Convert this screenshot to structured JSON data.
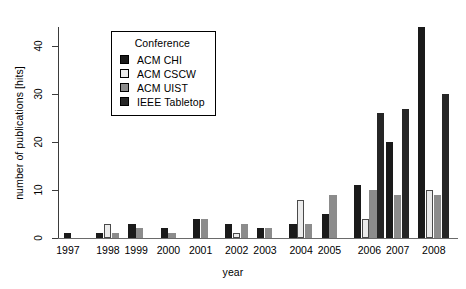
{
  "chart_data": {
    "type": "bar",
    "title": "",
    "subtitle": "",
    "xlabel": "year",
    "ylabel": "number of publications [hits]",
    "categories": [
      "1997",
      "1998",
      "1999",
      "2000",
      "2001",
      "2002",
      "2003",
      "2004",
      "2005",
      "2006",
      "2007",
      "2008"
    ],
    "ylim": [
      0,
      44
    ],
    "yticks": [
      0,
      10,
      20,
      30,
      40
    ],
    "ytick_labels": [
      "0",
      "10",
      "20",
      "30",
      "40"
    ],
    "grid": false,
    "legend_position": "top-left-inside",
    "legend_title": "Conference",
    "series": [
      {
        "name": "ACM CHI",
        "color": "#1a1a1a",
        "values": [
          1,
          1,
          3,
          2,
          4,
          3,
          2,
          3,
          5,
          11,
          20,
          44
        ]
      },
      {
        "name": "ACM CSCW",
        "color": "#ececec",
        "values": [
          0,
          3,
          0,
          0,
          0,
          1,
          0,
          8,
          0,
          4,
          0,
          10
        ]
      },
      {
        "name": "ACM UIST",
        "color": "#8c8c8c",
        "values": [
          0,
          1,
          2,
          1,
          4,
          3,
          2,
          3,
          9,
          10,
          9,
          9
        ]
      },
      {
        "name": "IEEE Tabletop",
        "color": "#262626",
        "values": [
          0,
          0,
          0,
          0,
          0,
          0,
          0,
          0,
          0,
          26,
          27,
          30
        ]
      }
    ]
  },
  "axes": {
    "y_axis_label": "number of publications [hits]",
    "x_axis_label": "year"
  },
  "legend": {
    "title": "Conference",
    "entries": [
      {
        "label": "ACM CHI",
        "color": "#1a1a1a"
      },
      {
        "label": "ACM CSCW",
        "color": "#ececec"
      },
      {
        "label": "ACM UIST",
        "color": "#8c8c8c"
      },
      {
        "label": "IEEE Tabletop",
        "color": "#262626"
      }
    ]
  }
}
